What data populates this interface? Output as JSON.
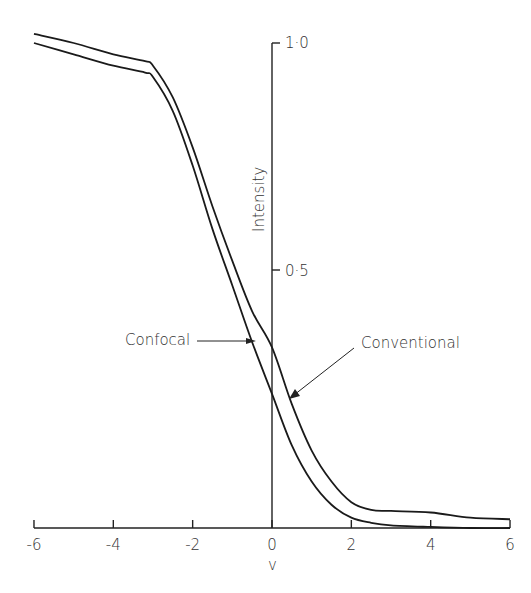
{
  "chart_data": {
    "type": "line",
    "title": "",
    "xlabel": "v",
    "ylabel": "Intensity",
    "xlim": [
      -6,
      6
    ],
    "ylim": [
      0,
      1.0
    ],
    "x_ticks": [
      -6,
      -4,
      -2,
      0,
      2,
      4,
      6
    ],
    "x_tick_labels": [
      "-6",
      "-4",
      "-2",
      "0",
      "2",
      "4",
      "6"
    ],
    "y_ticks": [
      0.5,
      1.0
    ],
    "y_tick_labels": [
      "0.5",
      "1.0"
    ],
    "grid": false,
    "legend": "none (annotated with arrows)",
    "series": [
      {
        "name": "Conventional",
        "x": [
          -6,
          -5,
          -4,
          -3.2,
          -3,
          -2.5,
          -2,
          -1.5,
          -1,
          -0.5,
          0,
          0.5,
          1,
          1.5,
          2,
          2.5,
          3,
          4,
          5,
          6
        ],
        "values": [
          1.02,
          1.0,
          0.975,
          0.96,
          0.95,
          0.88,
          0.77,
          0.64,
          0.52,
          0.42,
          0.35,
          0.24,
          0.15,
          0.09,
          0.05,
          0.035,
          0.033,
          0.03,
          0.02,
          0.017
        ]
      },
      {
        "name": "Confocal",
        "x": [
          -6,
          -5,
          -4,
          -3.2,
          -3,
          -2.5,
          -2,
          -1.5,
          -1,
          -0.5,
          0,
          0.5,
          1,
          1.5,
          2,
          2.5,
          3,
          4,
          5,
          6
        ],
        "values": [
          1.0,
          0.975,
          0.95,
          0.935,
          0.925,
          0.85,
          0.73,
          0.59,
          0.47,
          0.36,
          0.26,
          0.16,
          0.09,
          0.045,
          0.02,
          0.01,
          0.005,
          0.002,
          0.0,
          0.0
        ]
      }
    ],
    "annotations": [
      {
        "text": "Confocal",
        "points_to_series": "Confocal",
        "arrow_to": [
          -0.4,
          0.34
        ]
      },
      {
        "text": "Conventional",
        "points_to_series": "Conventional",
        "arrow_to": [
          0.43,
          0.25
        ]
      }
    ]
  },
  "labels": {
    "ylabel": "Intensity",
    "xlabel": "v",
    "y_top": "1·0",
    "y_mid": "0·5",
    "annotation_confocal": "Confocal",
    "annotation_conventional": "Conventional"
  },
  "colors": {
    "line": "#1a1a1a",
    "axis": "#222222",
    "text": "#333333"
  }
}
